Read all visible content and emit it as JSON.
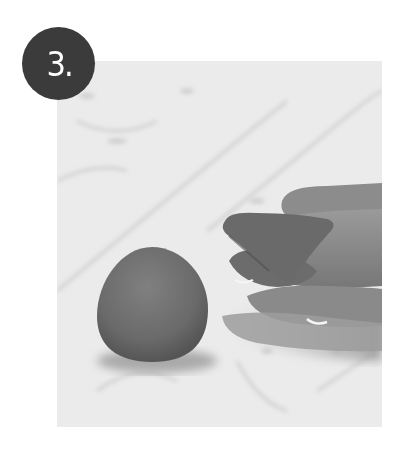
{
  "step": {
    "number_label": "3.",
    "badge_color": "#3b3b3b",
    "badge_text_color": "#ffffff"
  },
  "photo": {
    "description": "Grayscale photo on a marble surface: a rounded egg-shaped ball of clay on the left and a hand on the right holding a small folded triangular piece of clay between its fingers",
    "background_color": "#ebebeb",
    "objects": [
      {
        "name": "clay-ball",
        "shape": "egg",
        "color": "#6e6e6e"
      },
      {
        "name": "hand",
        "color": "#8a8a8a"
      },
      {
        "name": "folded-clay-piece",
        "shape": "triangular-cone",
        "color": "#6a6a6a"
      }
    ]
  }
}
